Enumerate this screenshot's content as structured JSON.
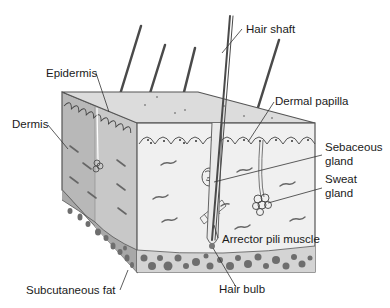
{
  "diagram": {
    "colors": {
      "outline": "#555555",
      "top_face": "#dcdcdc",
      "left_face": "#b8b8b8",
      "left_epidermis": "#c8c8c8",
      "front_face": "#f0f0f0",
      "fat_cells": "#6e6e6e",
      "fat_bg_front": "#d4d4d4",
      "fat_bg_left": "#a8a8a8",
      "hair": "#4a4a4a",
      "leader_line": "#333333",
      "text": "#1a1a1a"
    },
    "labels": {
      "hair_shaft": "Hair shaft",
      "epidermis": "Epidermis",
      "dermal_papilla": "Dermal papilla",
      "dermis": "Dermis",
      "sebaceous_gland_line1": "Sebaceous",
      "sebaceous_gland_line2": "gland",
      "sweat_gland_line1": "Sweat",
      "sweat_gland_line2": "gland",
      "arrector_pili_muscle": "Arrector pili muscle",
      "subcutaneous_fat": "Subcutaneous fat",
      "hair_bulb": "Hair bulb"
    }
  }
}
